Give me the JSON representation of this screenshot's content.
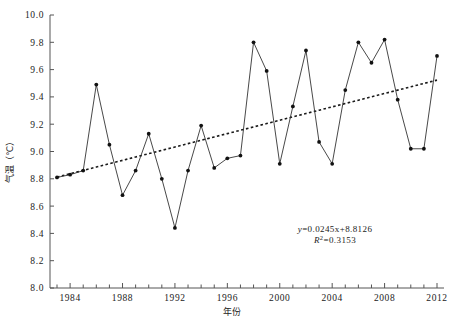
{
  "chart_data": {
    "type": "line",
    "title": "",
    "xlabel": "年份",
    "ylabel": "气温（℃）",
    "xlim": [
      1983,
      2012
    ],
    "ylim": [
      8.0,
      10.0
    ],
    "y_ticks": [
      "10.0",
      "9.8",
      "9.6",
      "9.4",
      "9.2",
      "9.0",
      "8.8",
      "8.6",
      "8.4",
      "8.2",
      "8.0"
    ],
    "y_tick_values": [
      10.0,
      9.8,
      9.6,
      9.4,
      9.2,
      9.0,
      8.8,
      8.6,
      8.4,
      8.2,
      8.0
    ],
    "x_ticks": [
      "1984",
      "1988",
      "1992",
      "1996",
      "2000",
      "2004",
      "2008",
      "2012"
    ],
    "x_tick_values": [
      1984,
      1988,
      1992,
      1996,
      2000,
      2004,
      2008,
      2012
    ],
    "x_minor_step": 1,
    "grid": false,
    "legend": "none",
    "x": [
      1983,
      1984,
      1985,
      1986,
      1987,
      1988,
      1989,
      1990,
      1991,
      1992,
      1993,
      1994,
      1995,
      1996,
      1997,
      1998,
      1999,
      2000,
      2001,
      2002,
      2003,
      2004,
      2005,
      2006,
      2007,
      2008,
      2009,
      2010,
      2011,
      2012
    ],
    "series": [
      {
        "name": "气温",
        "style": "solid-with-markers",
        "color": "#1a1a1a",
        "values": [
          8.81,
          8.83,
          8.86,
          9.49,
          9.05,
          8.68,
          8.86,
          9.13,
          8.8,
          8.44,
          8.86,
          9.19,
          8.88,
          8.95,
          8.97,
          9.8,
          9.59,
          8.91,
          9.33,
          9.74,
          9.07,
          8.91,
          9.45,
          9.8,
          9.65,
          9.82,
          9.38,
          9.02,
          9.02,
          9.7
        ]
      },
      {
        "name": "线性趋势线",
        "style": "dotted",
        "color": "#1a1a1a",
        "equation": "y=0.0245x+8.8126",
        "r_squared": "0.3153",
        "slope": 0.0245,
        "intercept": 8.8126,
        "values": [
          8.8126,
          8.8371,
          8.8616,
          8.8861,
          8.9106,
          8.9351,
          8.9596,
          8.9841,
          9.0086,
          9.0331,
          9.0576,
          9.0821,
          9.1066,
          9.1311,
          9.1556,
          9.1801,
          9.2046,
          9.2291,
          9.2536,
          9.2781,
          9.3026,
          9.3271,
          9.3516,
          9.3761,
          9.4006,
          9.4251,
          9.4496,
          9.4741,
          9.4986,
          9.5231
        ]
      }
    ],
    "annotations": {
      "equation_line1_prefix": "y",
      "equation_line1_body": "=0.0245x+8.8126",
      "equation_line2_prefix": "R",
      "equation_line2_sup": "2",
      "equation_line2_body": "=0.3153"
    }
  }
}
